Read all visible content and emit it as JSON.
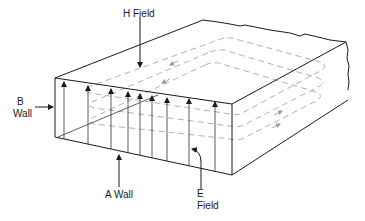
{
  "figure": {
    "labels": {
      "h_field": "H Field",
      "b_wall_line1": "B",
      "b_wall_line2": "Wall",
      "a_wall": "A Wall",
      "e_field_line1": "E",
      "e_field_line2": "Field"
    },
    "colors": {
      "outline": "#1a1a1a",
      "h_field_loops": "#a8a8a8",
      "background": "#ffffff"
    },
    "e_field_arrow_count": 10,
    "h_field_loop_count": 3
  }
}
